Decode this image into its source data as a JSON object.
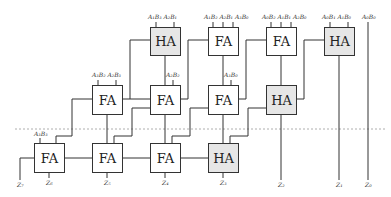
{
  "diagram": {
    "colors": {
      "ha_fill": "#e6e6e6",
      "fa_fill": "#ffffff",
      "stroke": "#333333",
      "divider": "#999999"
    },
    "row1": [
      {
        "type": "HA",
        "inputs": "A₁B₃  A₂B₁"
      },
      {
        "type": "FA",
        "inputs": "A₁B₂  A₂B₁  A₃B₀"
      },
      {
        "type": "FA",
        "inputs": "A₀B₂  A₁B₁  A₂B₀"
      },
      {
        "type": "HA",
        "inputs": "A₀B₁  A₁B₀"
      }
    ],
    "row1_extra_input": "A₀B₀",
    "row2": [
      {
        "type": "FA",
        "inputs": "A₃B₂  A₂B₃"
      },
      {
        "type": "FA",
        "inputs": "A₂B₂"
      },
      {
        "type": "FA",
        "inputs": "A₃B₀"
      },
      {
        "type": "HA",
        "inputs": ""
      }
    ],
    "row3": [
      {
        "type": "FA",
        "inputs": "A₃B₃"
      },
      {
        "type": "FA",
        "inputs": ""
      },
      {
        "type": "FA",
        "inputs": ""
      },
      {
        "type": "HA",
        "inputs": ""
      }
    ],
    "outputs": [
      "Z₇",
      "Z₆",
      "Z₅",
      "Z₄",
      "Z₃",
      "Z₂",
      "Z₁",
      "Z₀"
    ]
  }
}
